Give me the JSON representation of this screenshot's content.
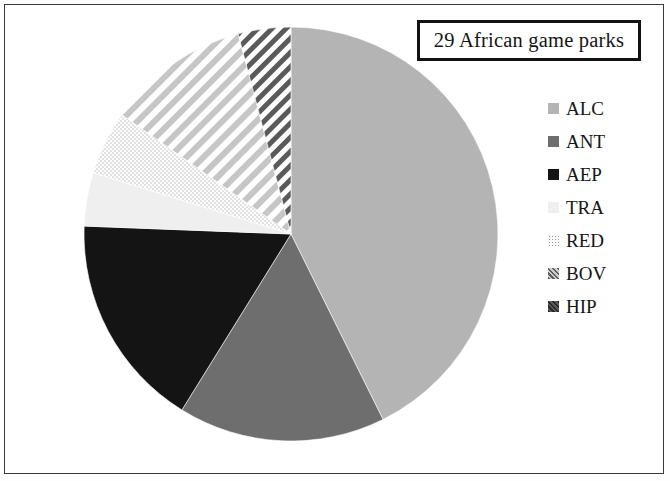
{
  "figure": {
    "title": "29 African game parks",
    "background_color": "#ffffff",
    "border_color": "#3a3a3a"
  },
  "legend": {
    "position": "right",
    "items": [
      {
        "label": "ALC",
        "color": "#b4b4b4",
        "fill": "solid"
      },
      {
        "label": "ANT",
        "color": "#6e6e6e",
        "fill": "solid"
      },
      {
        "label": "AEP",
        "color": "#141414",
        "fill": "solid"
      },
      {
        "label": "TRA",
        "color": "#efefef",
        "fill": "solid"
      },
      {
        "label": "RED",
        "color": "#fafafa",
        "fill": "dot"
      },
      {
        "label": "BOV",
        "color": "#cfcfcf",
        "fill": "hatch"
      },
      {
        "label": "HIP",
        "color": "#5a5a5a",
        "fill": "hatch"
      }
    ]
  },
  "chart_data": {
    "type": "pie",
    "title": "29 African game parks",
    "xlabel": "",
    "ylabel": "",
    "total_label": "29 African game parks",
    "total": 29,
    "start_angle_deg": 0,
    "direction": "clockwise",
    "categories": [
      "ALC",
      "ANT",
      "AEP",
      "TRA",
      "RED",
      "BOV",
      "HIP"
    ],
    "values": [
      12.4,
      4.7,
      4.9,
      1.2,
      1.5,
      3.2,
      1.1
    ],
    "percentages": [
      42.7,
      16.1,
      16.8,
      4.2,
      5.0,
      11.1,
      4.1
    ],
    "angles_deg": [
      153.6,
      58.2,
      60.4,
      15.0,
      18.0,
      40.0,
      14.8
    ],
    "colors": [
      "#b4b4b4",
      "#6e6e6e",
      "#141414",
      "#efefef",
      "#fafafa",
      "#cfcfcf",
      "#5a5a5a"
    ],
    "fills": [
      "solid",
      "solid",
      "solid",
      "solid",
      "dot",
      "hatch",
      "hatch"
    ],
    "legend": [
      "ALC",
      "ANT",
      "AEP",
      "TRA",
      "RED",
      "BOV",
      "HIP"
    ],
    "grid": false,
    "center": {
      "x": 291,
      "y": 234
    },
    "radius": 207
  }
}
